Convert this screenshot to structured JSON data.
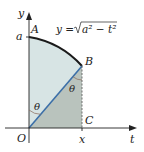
{
  "figure": {
    "curve_label": "y = √a² − t²",
    "curve_label_parts": {
      "lhs": "y =",
      "radicand": "a² − t²"
    },
    "axis_x_label": "t",
    "axis_y_label": "y",
    "points": {
      "A": "A",
      "B": "B",
      "C": "C",
      "O": "O"
    },
    "tick_labels": {
      "y_intercept": "a",
      "x_value": "x"
    },
    "angle_label": "θ",
    "colors": {
      "sector_fill": "#d7e4e4",
      "triangle_fill": "#b9c3bd",
      "radius_line": "#3b6fa8",
      "curve": "#1a1a1a",
      "axes": "#222222",
      "dashed_line": "#555555",
      "angle_arc": "#8a6a5a"
    }
  }
}
